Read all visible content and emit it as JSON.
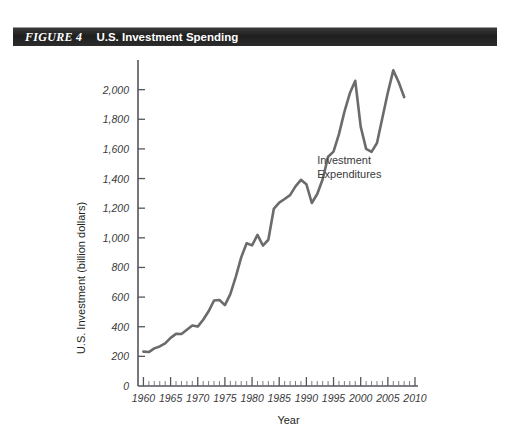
{
  "figure": {
    "number_label": "FIGURE 4",
    "title": "U.S. Investment Spending"
  },
  "chart_data": {
    "type": "line",
    "title": "U.S. Investment Spending",
    "xlabel": "Year",
    "ylabel": "U.S. Investment (billion dollars)",
    "xlim": [
      1959,
      2010
    ],
    "ylim": [
      0,
      2200
    ],
    "y_ticks": [
      0,
      200,
      400,
      600,
      800,
      1000,
      1200,
      1400,
      1600,
      1800,
      2000
    ],
    "y_tick_labels": [
      "0",
      "200",
      "400",
      "600",
      "800",
      "1,000",
      "1,200",
      "1,400",
      "1,600",
      "1,800",
      "2,000"
    ],
    "x_ticks": [
      1960,
      1965,
      1970,
      1975,
      1980,
      1985,
      1990,
      1995,
      2000,
      2005,
      2010
    ],
    "x_tick_labels": [
      "1960",
      "1965",
      "1970",
      "1975",
      "1980",
      "1985",
      "1990",
      "1995",
      "2000",
      "2005",
      "2010"
    ],
    "x_minor_tick_step": 1,
    "grid": false,
    "legend_position": "none",
    "annotations": [
      {
        "text_line1": "Investment",
        "text_line2": "Expenditures",
        "x": 1992,
        "y": 1500
      }
    ],
    "series": [
      {
        "name": "Investment Expenditures",
        "color": "#6b6b6b",
        "x": [
          1960,
          1961,
          1962,
          1963,
          1964,
          1965,
          1966,
          1967,
          1968,
          1969,
          1970,
          1971,
          1972,
          1973,
          1974,
          1975,
          1976,
          1977,
          1978,
          1979,
          1980,
          1981,
          1982,
          1983,
          1984,
          1985,
          1986,
          1987,
          1988,
          1989,
          1990,
          1991,
          1992,
          1993,
          1994,
          1995,
          1996,
          1997,
          1998,
          1999,
          2000,
          2001,
          2002,
          2003,
          2004,
          2005,
          2006,
          2007,
          2008
        ],
        "values": [
          232,
          229,
          254,
          267,
          287,
          325,
          352,
          351,
          379,
          408,
          401,
          447,
          504,
          577,
          580,
          546,
          620,
          737,
          868,
          963,
          949,
          1020,
          948,
          987,
          1195,
          1238,
          1262,
          1288,
          1347,
          1391,
          1362,
          1235,
          1296,
          1395,
          1547,
          1582,
          1700,
          1850,
          1975,
          2060,
          1750,
          1600,
          1580,
          1640,
          1810,
          1980,
          2130,
          2050,
          1950
        ]
      }
    ]
  }
}
